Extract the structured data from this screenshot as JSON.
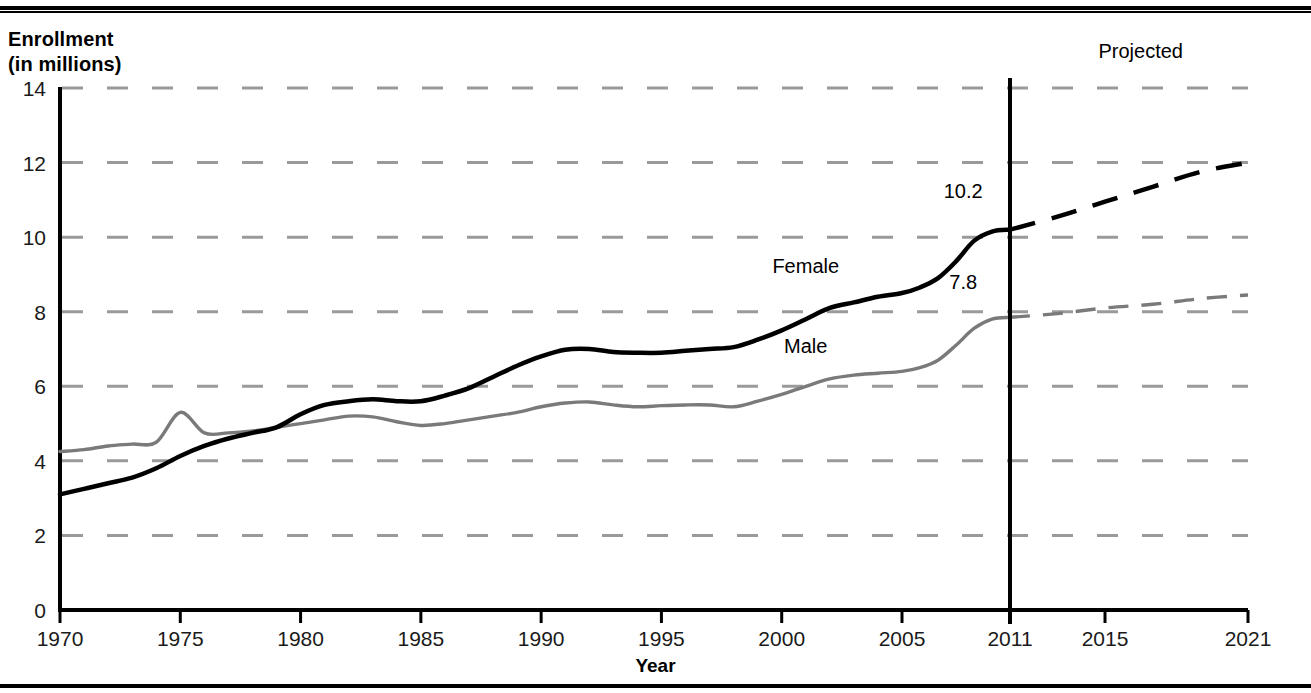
{
  "figure": {
    "y_axis_title": "Enrollment\n(in millions)",
    "x_axis_title": "Year",
    "projected_label": "Projected",
    "label_female": "Female",
    "label_male": "Male",
    "value_label_female": "10.2",
    "value_label_male": "7.8",
    "color_female": "#000000",
    "color_male": "#7a7a7a",
    "color_grid": "#9a9a9a",
    "color_axis": "#000000"
  },
  "chart_data": {
    "type": "line",
    "title": "",
    "xlabel": "Year",
    "ylabel": "Enrollment (in millions)",
    "xlim": [
      1970,
      2021
    ],
    "ylim": [
      0,
      14
    ],
    "grid": true,
    "grid_style": "dashed-horizontal",
    "legend": "inline-series-labels",
    "x_ticks": [
      1970,
      1975,
      1980,
      1985,
      1990,
      1995,
      2000,
      2005,
      2011,
      2015,
      2021
    ],
    "y_ticks": [
      0,
      2,
      4,
      6,
      8,
      10,
      12,
      14
    ],
    "projection_start_year": 2011,
    "annotations": [
      {
        "text": "Projected",
        "x": 2016.5,
        "y": 14.8
      },
      {
        "text": "Female",
        "x": 2001.0,
        "y": 9.05
      },
      {
        "text": "Male",
        "x": 2001.0,
        "y": 6.9
      },
      {
        "text": "10.2",
        "x": 2008.4,
        "y": 11.05
      },
      {
        "text": "7.8",
        "x": 2008.4,
        "y": 8.62
      }
    ],
    "series": [
      {
        "name": "Female",
        "color": "#000000",
        "width": 4.5,
        "actual": [
          {
            "x": 1970,
            "y": 3.1
          },
          {
            "x": 1971,
            "y": 3.25
          },
          {
            "x": 1972,
            "y": 3.4
          },
          {
            "x": 1973,
            "y": 3.55
          },
          {
            "x": 1974,
            "y": 3.8
          },
          {
            "x": 1975,
            "y": 4.13
          },
          {
            "x": 1976,
            "y": 4.4
          },
          {
            "x": 1977,
            "y": 4.6
          },
          {
            "x": 1978,
            "y": 4.75
          },
          {
            "x": 1979,
            "y": 4.9
          },
          {
            "x": 1980,
            "y": 5.25
          },
          {
            "x": 1981,
            "y": 5.5
          },
          {
            "x": 1982,
            "y": 5.6
          },
          {
            "x": 1983,
            "y": 5.65
          },
          {
            "x": 1984,
            "y": 5.6
          },
          {
            "x": 1985,
            "y": 5.6
          },
          {
            "x": 1986,
            "y": 5.75
          },
          {
            "x": 1987,
            "y": 5.95
          },
          {
            "x": 1988,
            "y": 6.25
          },
          {
            "x": 1989,
            "y": 6.55
          },
          {
            "x": 1990,
            "y": 6.8
          },
          {
            "x": 1991,
            "y": 6.98
          },
          {
            "x": 1992,
            "y": 7.0
          },
          {
            "x": 1993,
            "y": 6.92
          },
          {
            "x": 1994,
            "y": 6.9
          },
          {
            "x": 1995,
            "y": 6.9
          },
          {
            "x": 1996,
            "y": 6.95
          },
          {
            "x": 1997,
            "y": 7.0
          },
          {
            "x": 1998,
            "y": 7.05
          },
          {
            "x": 1999,
            "y": 7.25
          },
          {
            "x": 2000,
            "y": 7.5
          },
          {
            "x": 2001,
            "y": 7.8
          },
          {
            "x": 2002,
            "y": 8.1
          },
          {
            "x": 2003,
            "y": 8.25
          },
          {
            "x": 2004,
            "y": 8.4
          },
          {
            "x": 2005,
            "y": 8.5
          },
          {
            "x": 2006,
            "y": 8.65
          },
          {
            "x": 2007,
            "y": 8.9
          },
          {
            "x": 2008,
            "y": 9.35
          },
          {
            "x": 2009,
            "y": 9.9
          },
          {
            "x": 2010,
            "y": 10.15
          },
          {
            "x": 2011,
            "y": 10.2
          }
        ],
        "projected": [
          {
            "x": 2011,
            "y": 10.2
          },
          {
            "x": 2013,
            "y": 10.55
          },
          {
            "x": 2015,
            "y": 10.95
          },
          {
            "x": 2017,
            "y": 11.35
          },
          {
            "x": 2019,
            "y": 11.75
          },
          {
            "x": 2021,
            "y": 12.0
          }
        ]
      },
      {
        "name": "Male",
        "color": "#7a7a7a",
        "width": 3.4,
        "actual": [
          {
            "x": 1970,
            "y": 4.25
          },
          {
            "x": 1971,
            "y": 4.3
          },
          {
            "x": 1972,
            "y": 4.4
          },
          {
            "x": 1973,
            "y": 4.45
          },
          {
            "x": 1974,
            "y": 4.5
          },
          {
            "x": 1975,
            "y": 5.3
          },
          {
            "x": 1976,
            "y": 4.75
          },
          {
            "x": 1977,
            "y": 4.75
          },
          {
            "x": 1978,
            "y": 4.8
          },
          {
            "x": 1979,
            "y": 4.9
          },
          {
            "x": 1980,
            "y": 5.0
          },
          {
            "x": 1981,
            "y": 5.1
          },
          {
            "x": 1982,
            "y": 5.2
          },
          {
            "x": 1983,
            "y": 5.18
          },
          {
            "x": 1984,
            "y": 5.05
          },
          {
            "x": 1985,
            "y": 4.95
          },
          {
            "x": 1986,
            "y": 5.0
          },
          {
            "x": 1987,
            "y": 5.1
          },
          {
            "x": 1988,
            "y": 5.2
          },
          {
            "x": 1989,
            "y": 5.3
          },
          {
            "x": 1990,
            "y": 5.45
          },
          {
            "x": 1991,
            "y": 5.55
          },
          {
            "x": 1992,
            "y": 5.58
          },
          {
            "x": 1993,
            "y": 5.5
          },
          {
            "x": 1994,
            "y": 5.45
          },
          {
            "x": 1995,
            "y": 5.48
          },
          {
            "x": 1996,
            "y": 5.5
          },
          {
            "x": 1997,
            "y": 5.5
          },
          {
            "x": 1998,
            "y": 5.45
          },
          {
            "x": 1999,
            "y": 5.6
          },
          {
            "x": 2000,
            "y": 5.78
          },
          {
            "x": 2001,
            "y": 6.0
          },
          {
            "x": 2002,
            "y": 6.2
          },
          {
            "x": 2003,
            "y": 6.3
          },
          {
            "x": 2004,
            "y": 6.35
          },
          {
            "x": 2005,
            "y": 6.4
          },
          {
            "x": 2006,
            "y": 6.5
          },
          {
            "x": 2007,
            "y": 6.7
          },
          {
            "x": 2008,
            "y": 7.1
          },
          {
            "x": 2009,
            "y": 7.55
          },
          {
            "x": 2010,
            "y": 7.8
          },
          {
            "x": 2011,
            "y": 7.85
          }
        ],
        "projected": [
          {
            "x": 2011,
            "y": 7.85
          },
          {
            "x": 2013,
            "y": 7.95
          },
          {
            "x": 2015,
            "y": 8.1
          },
          {
            "x": 2017,
            "y": 8.2
          },
          {
            "x": 2019,
            "y": 8.35
          },
          {
            "x": 2021,
            "y": 8.45
          }
        ]
      }
    ]
  }
}
